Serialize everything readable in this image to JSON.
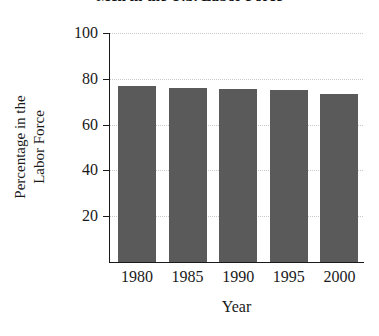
{
  "chart_data": {
    "type": "bar",
    "title": "Men in the U.S. Labor Force",
    "xlabel": "Year",
    "ylabel": "Percentage in the Labor Force",
    "ylabel_lines": [
      "Percentage in the",
      "Labor Force"
    ],
    "categories": [
      "1980",
      "1985",
      "1990",
      "1995",
      "2000"
    ],
    "values": [
      77,
      76,
      75.5,
      75,
      73.5
    ],
    "ylim": [
      0,
      100
    ],
    "yticks": [
      20,
      40,
      60,
      80,
      100
    ],
    "grid": "horizontal-dotted",
    "legend": "none",
    "bar_color": "#5a5a5a",
    "background_color": "#ffffff",
    "axis_color": "#1a1a1a",
    "gridline_color": "#c9c9c9"
  }
}
